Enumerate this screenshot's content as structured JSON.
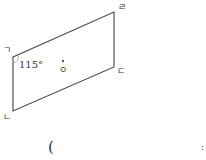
{
  "figure": {
    "vertices": {
      "top_left": {
        "label": "ㄱ",
        "x": 13,
        "y": 57
      },
      "bottom_left": {
        "label": "ㄴ",
        "x": 13,
        "y": 111
      },
      "bottom_right": {
        "label": "ㄷ",
        "x": 114,
        "y": 67
      },
      "top_right": {
        "label": "ㄹ",
        "x": 114,
        "y": 12
      }
    },
    "angle": {
      "value": "115°"
    },
    "center": {
      "label": "ㅇ"
    },
    "stroke_color": "#444444"
  },
  "answer": {
    "open_paren": "(",
    "close_mark": ":"
  }
}
